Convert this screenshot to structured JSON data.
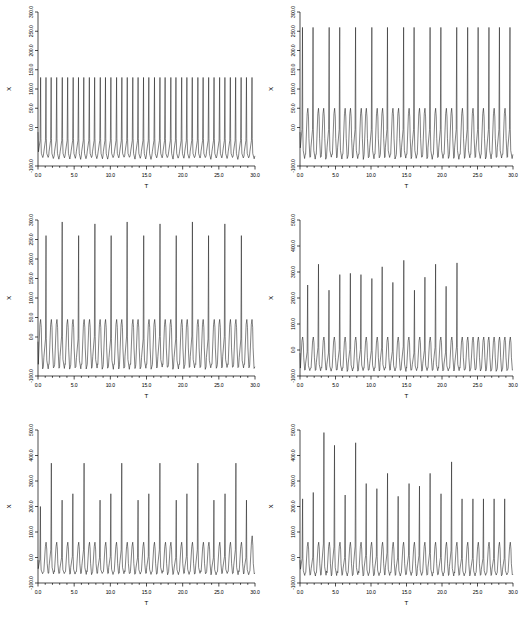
{
  "figure": {
    "name": "six-panel-time-series-figure",
    "background_color": "#ffffff",
    "line_color": "#1a1a1a",
    "panel_rows": 3,
    "panel_columns": 2
  },
  "chart_data": [
    {
      "type": "line",
      "panel_id": "panel-top-left",
      "title": "",
      "xlabel": "T",
      "ylabel": "X",
      "xlim": [
        0.0,
        30.0
      ],
      "ylim": [
        -100.0,
        300.0
      ],
      "xticks": [
        0.0,
        5.0,
        10.0,
        15.0,
        20.0,
        25.0,
        30.0
      ],
      "xtick_labels": [
        "0.0",
        "5.0",
        "10.0",
        "15.0",
        "20.0",
        "25.0",
        "30.0"
      ],
      "yticks": [
        -100.0,
        0.0,
        50.0,
        100.0,
        150.0,
        200.0,
        250.0,
        300.0
      ],
      "ytick_labels": [
        "-100.0",
        "0.0",
        "50.0",
        "100.0",
        "150.0",
        "200.0",
        "250.0",
        "300.0"
      ],
      "grid": false,
      "legend": "none",
      "series": [
        {
          "name": "X(T)",
          "spike_period": 0.76,
          "spike_peak": 130,
          "burst_baseline_low": -80,
          "burst_baseline_high": 0,
          "description": "Uniform fast periodic spiking, peaks near 130, troughs near -80",
          "peaks": [
            130,
            130,
            130,
            130,
            130,
            130,
            130,
            130,
            130,
            130,
            130,
            130,
            130,
            130,
            130,
            130,
            130,
            130,
            130,
            130,
            130,
            130,
            130,
            130,
            130,
            130,
            130,
            130,
            130,
            130,
            130,
            130,
            130,
            130,
            130,
            130,
            130,
            130,
            130,
            130
          ]
        }
      ]
    },
    {
      "type": "line",
      "panel_id": "panel-top-right",
      "title": "",
      "xlabel": "T",
      "ylabel": "X",
      "xlim": [
        0.0,
        30.0
      ],
      "ylim": [
        -100.0,
        300.0
      ],
      "xticks": [
        0.0,
        5.0,
        10.0,
        15.0,
        20.0,
        25.0,
        30.0
      ],
      "xtick_labels": [
        "0.0",
        "5.0",
        "10.0",
        "15.0",
        "20.0",
        "25.0",
        "30.0"
      ],
      "yticks": [
        -100.0,
        0.0,
        50.0,
        100.0,
        150.0,
        200.0,
        250.0,
        300.0
      ],
      "ytick_labels": [
        "-100.0",
        "0.0",
        "50.0",
        "100.0",
        "150.0",
        "200.0",
        "250.0",
        "300.0"
      ],
      "grid": false,
      "legend": "none",
      "series": [
        {
          "name": "X(T)",
          "spike_period": 0.76,
          "tall_spike_peak": 260,
          "small_spike_peak": 50,
          "trough": -80,
          "description": "Period-2 pattern: tall spikes near 260 alternating with low humps near 50",
          "peaks": [
            260,
            50,
            260,
            50,
            50,
            260,
            50,
            260,
            50,
            50,
            260,
            50,
            50,
            260,
            50,
            50,
            260,
            50,
            50,
            260,
            50,
            260,
            50,
            50,
            260,
            50,
            260,
            50,
            50,
            260,
            50,
            260,
            50,
            260,
            50,
            260,
            50,
            260,
            50,
            260
          ]
        }
      ]
    },
    {
      "type": "line",
      "panel_id": "panel-middle-left",
      "title": "",
      "xlabel": "T",
      "ylabel": "X",
      "xlim": [
        0.0,
        30.0
      ],
      "ylim": [
        -100.0,
        300.0
      ],
      "xticks": [
        0.0,
        5.0,
        10.0,
        15.0,
        20.0,
        25.0,
        30.0
      ],
      "xtick_labels": [
        "0.0",
        "5.0",
        "10.0",
        "15.0",
        "20.0",
        "25.0",
        "30.0"
      ],
      "yticks": [
        -100.0,
        0.0,
        50.0,
        100.0,
        150.0,
        200.0,
        250.0,
        300.0
      ],
      "ytick_labels": [
        "-100.0",
        "0.0",
        "50.0",
        "100.0",
        "150.0",
        "200.0",
        "250.0",
        "300.0"
      ],
      "grid": false,
      "legend": "none",
      "series": [
        {
          "name": "X(T)",
          "spike_period": 0.76,
          "tall_spike_peak": 295,
          "medium_spike_peak": 260,
          "small_spike_peak": 45,
          "trough": -80,
          "description": "Large spikes near 260-300 every ~2 units with small humps near 45 between",
          "peaks": [
            45,
            260,
            45,
            45,
            295,
            45,
            45,
            260,
            45,
            45,
            290,
            45,
            45,
            260,
            45,
            45,
            295,
            45,
            45,
            260,
            45,
            45,
            290,
            45,
            45,
            260,
            45,
            45,
            295,
            45,
            45,
            260,
            45,
            45,
            290,
            45,
            45,
            260,
            45,
            45
          ]
        }
      ]
    },
    {
      "type": "line",
      "panel_id": "panel-middle-right",
      "title": "",
      "xlabel": "T",
      "ylabel": "X",
      "xlim": [
        0.0,
        30.0
      ],
      "ylim": [
        -100.0,
        500.0
      ],
      "xticks": [
        0.0,
        5.0,
        10.0,
        15.0,
        20.0,
        25.0,
        30.0
      ],
      "xtick_labels": [
        "0.0",
        "5.0",
        "10.0",
        "15.0",
        "20.0",
        "25.0",
        "30.0"
      ],
      "yticks": [
        -100.0,
        0.0,
        100.0,
        200.0,
        300.0,
        400.0,
        500.0
      ],
      "ytick_labels": [
        "-100.0",
        "0.0",
        "100.0",
        "200.0",
        "300.0",
        "400.0",
        "500.0"
      ],
      "grid": false,
      "legend": "none",
      "series": [
        {
          "name": "X(T)",
          "spike_period": 0.76,
          "trough": -80,
          "description": "Irregular chaotic spiking, peaks between 225 and 345, small humps near 50",
          "peaks": [
            50,
            250,
            50,
            330,
            50,
            230,
            50,
            290,
            50,
            295,
            50,
            290,
            50,
            275,
            50,
            320,
            50,
            260,
            50,
            345,
            50,
            230,
            50,
            280,
            50,
            330,
            50,
            245,
            50,
            335,
            50,
            50,
            50,
            50,
            50,
            50,
            50,
            50,
            50,
            50
          ]
        }
      ]
    },
    {
      "type": "line",
      "panel_id": "panel-bottom-left",
      "title": "",
      "xlabel": "T",
      "ylabel": "X",
      "xlim": [
        0.0,
        30.0
      ],
      "ylim": [
        -100.0,
        500.0
      ],
      "xticks": [
        0.0,
        5.0,
        10.0,
        15.0,
        20.0,
        25.0,
        30.0
      ],
      "xtick_labels": [
        "0.0",
        "5.0",
        "10.0",
        "15.0",
        "20.0",
        "25.0",
        "30.0"
      ],
      "yticks": [
        -100.0,
        0.0,
        100.0,
        200.0,
        300.0,
        400.0,
        500.0
      ],
      "ytick_labels": [
        "-100.0",
        "0.0",
        "100.0",
        "200.0",
        "300.0",
        "400.0",
        "500.0"
      ],
      "grid": false,
      "legend": "none",
      "series": [
        {
          "name": "X(T)",
          "spike_period": 0.62,
          "trough": -65,
          "description": "Alternating tall spikes near 370 and medium spikes near 230, small humps near 60",
          "peaks": [
            200,
            60,
            370,
            60,
            225,
            60,
            250,
            60,
            370,
            60,
            60,
            225,
            60,
            250,
            60,
            370,
            60,
            60,
            225,
            60,
            250,
            60,
            370,
            60,
            60,
            225,
            60,
            250,
            60,
            370,
            60,
            60,
            225,
            60,
            250,
            60,
            370,
            60,
            225,
            85
          ]
        }
      ]
    },
    {
      "type": "line",
      "panel_id": "panel-bottom-right",
      "title": "",
      "xlabel": "T",
      "ylabel": "X",
      "xlim": [
        0.0,
        30.0
      ],
      "ylim": [
        -100.0,
        500.0
      ],
      "xticks": [
        0.0,
        5.0,
        10.0,
        15.0,
        20.0,
        25.0,
        30.0
      ],
      "xtick_labels": [
        "0.0",
        "5.0",
        "10.0",
        "15.0",
        "20.0",
        "25.0",
        "30.0"
      ],
      "yticks": [
        -100.0,
        0.0,
        100.0,
        200.0,
        300.0,
        400.0,
        500.0
      ],
      "ytick_labels": [
        "-100.0",
        "0.0",
        "100.0",
        "200.0",
        "300.0",
        "400.0",
        "500.0"
      ],
      "grid": false,
      "legend": "none",
      "series": [
        {
          "name": "X(T)",
          "spike_period": 0.62,
          "trough": -70,
          "description": "Highly irregular chaotic spiking, peaks between 230 and 490",
          "peaks": [
            230,
            60,
            255,
            60,
            490,
            60,
            440,
            60,
            245,
            60,
            450,
            60,
            290,
            60,
            270,
            60,
            330,
            60,
            240,
            60,
            290,
            60,
            280,
            60,
            330,
            60,
            250,
            60,
            375,
            60,
            230,
            60,
            230,
            60,
            230,
            60,
            230,
            60,
            230,
            60
          ]
        }
      ]
    }
  ]
}
